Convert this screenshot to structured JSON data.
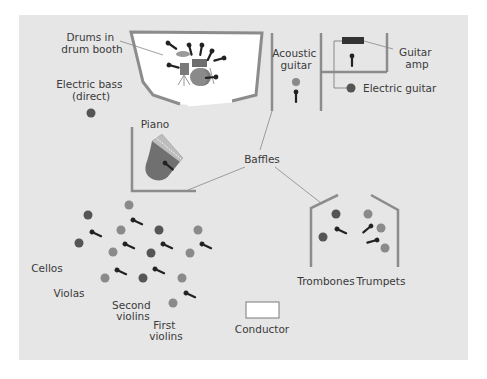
{
  "colors": {
    "page_bg": "#ffffff",
    "panel_bg": "#e6e6e6",
    "baffle": "#8c8c8c",
    "booth_fill": "#ffffff",
    "dark_circle": "#555555",
    "mid_circle": "#8a8a8a",
    "mic": "#222222",
    "leader_line": "#888888",
    "text": "#3a3a3a"
  },
  "labels": {
    "drums": [
      "Drums in",
      "drum booth"
    ],
    "electric_bass": [
      "Electric bass",
      "(direct)"
    ],
    "piano": [
      "Piano"
    ],
    "acoustic_guitar": [
      "Acoustic",
      "guitar"
    ],
    "guitar_amp": [
      "Guitar",
      "amp"
    ],
    "electric_guitar": [
      "Electric guitar"
    ],
    "baffles": [
      "Baffles"
    ],
    "trombones": [
      "Trombones"
    ],
    "trumpets": [
      "Trumpets"
    ],
    "cellos": [
      "Cellos"
    ],
    "violas": [
      "Violas"
    ],
    "second_violins": [
      "Second",
      "violins"
    ],
    "first_violins": [
      "First",
      "violins"
    ],
    "conductor": [
      "Conductor"
    ]
  }
}
